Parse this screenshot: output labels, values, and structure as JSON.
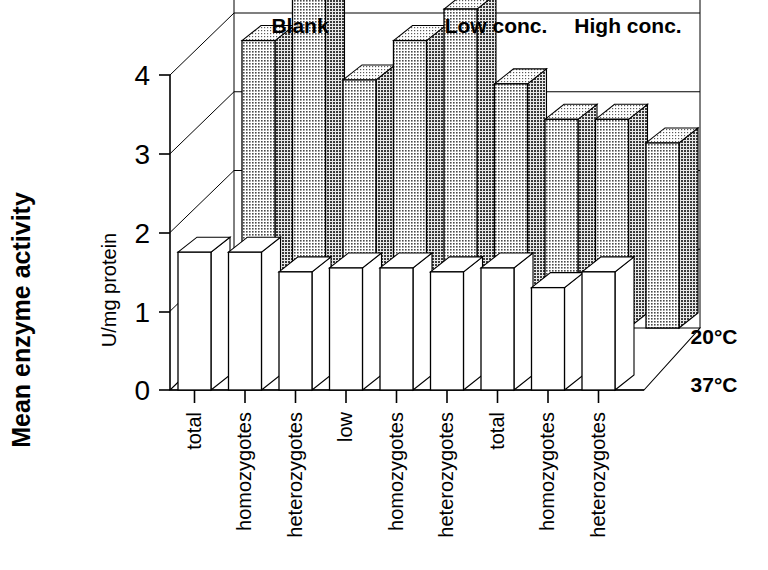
{
  "chart_data": {
    "type": "bar",
    "title": "",
    "subtitle": "",
    "ylabel": "Mean enzyme activity",
    "ylabel_units": "U/mg protein",
    "xlabel": "",
    "ylim": [
      0,
      4.4
    ],
    "yticks": [
      0,
      1,
      2,
      3,
      4
    ],
    "ytick_labels": [
      "0",
      "1",
      "2",
      "3",
      "4"
    ],
    "grid": true,
    "legend_position": "right-depth-axis",
    "depth_axis_name": "Temperature",
    "depth_categories": [
      "20°C",
      "37°C"
    ],
    "group_labels": [
      "Blank",
      "Low conc.",
      "High conc."
    ],
    "categories": [
      "total",
      "homozygotes",
      "heterozygotes",
      "low",
      "homozygotes",
      "heterozygotes",
      "total",
      "homozygotes",
      "heterozygotes"
    ],
    "series": [
      {
        "name": "20°C",
        "fill": "#b0b0b0",
        "values": [
          3.65,
          4.3,
          3.15,
          3.65,
          4.05,
          3.1,
          2.65,
          2.65,
          2.35
        ]
      },
      {
        "name": "37°C",
        "fill": "#ffffff",
        "values": [
          1.75,
          1.75,
          1.5,
          1.55,
          1.55,
          1.5,
          1.55,
          1.3,
          1.5
        ]
      }
    ]
  },
  "axis": {
    "y_title_main": "Mean enzyme activity",
    "y_title_sub": "U/mg protein",
    "tick_0": "0",
    "tick_1": "1",
    "tick_2": "2",
    "tick_3": "3",
    "tick_4": "4"
  },
  "groups": {
    "blank": "Blank",
    "low": "Low conc.",
    "high": "High conc."
  },
  "depth": {
    "back": "20°C",
    "front": "37°C"
  },
  "categories": {
    "c0": "total",
    "c1": "homozygotes",
    "c2": "heterozygotes",
    "c3": "low",
    "c4": "homozygotes",
    "c5": "heterozygotes",
    "c6": "total",
    "c7": "homozygotes",
    "c8": "heterozygotes"
  }
}
